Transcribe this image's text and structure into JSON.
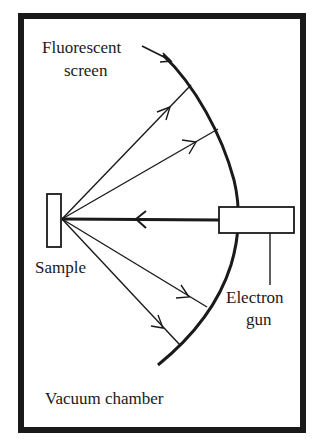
{
  "diagram": {
    "labels": {
      "screen_line1": "Fluorescent",
      "screen_line2": "screen",
      "sample": "Sample",
      "gun_line1": "Electron",
      "gun_line2": "gun",
      "chamber": "Vacuum chamber"
    },
    "components": [
      {
        "id": "vacuum-chamber",
        "shape": "rectangle-frame"
      },
      {
        "id": "fluorescent-screen",
        "shape": "arc"
      },
      {
        "id": "sample",
        "shape": "small-rectangle"
      },
      {
        "id": "electron-gun",
        "shape": "rectangle"
      },
      {
        "id": "incident-beam",
        "shape": "arrow",
        "from": "electron-gun",
        "to": "sample"
      },
      {
        "id": "diffracted-rays",
        "shape": "arrows",
        "count": 4,
        "from": "sample",
        "to": "fluorescent-screen"
      }
    ],
    "colors": {
      "ink": "#1a1a1a",
      "background": "#ffffff"
    }
  }
}
